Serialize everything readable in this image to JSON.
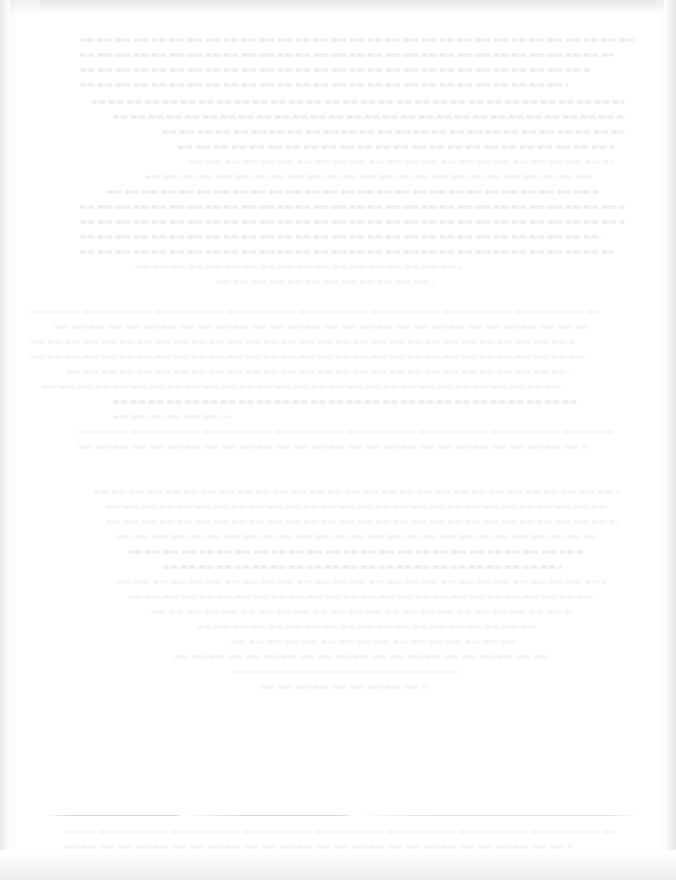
{
  "document": {
    "type": "scanned page (faded, text illegible)",
    "header_lines": [
      "",
      "",
      "",
      ""
    ],
    "body_paragraphs": [
      {
        "lines": [
          "",
          "",
          "",
          "",
          "",
          "",
          "",
          "",
          "",
          "",
          "",
          "",
          ""
        ]
      },
      {
        "lines": [
          "",
          "",
          "",
          "",
          "",
          "",
          "",
          "",
          "",
          ""
        ]
      },
      {
        "lines": [
          "",
          "",
          "",
          "",
          "",
          "",
          "",
          "",
          "",
          "",
          "",
          "",
          "",
          ""
        ]
      }
    ],
    "footnote_lines": [
      "",
      ""
    ],
    "colors": {
      "paper": "#ffffff",
      "edge_shadow": "#e6e6e6",
      "ink_faded": "#ececec"
    }
  }
}
